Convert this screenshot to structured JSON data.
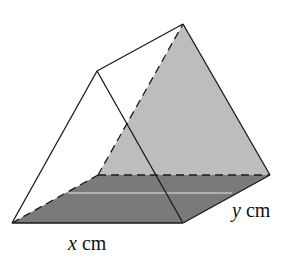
{
  "figure": {
    "type": "triangular prism",
    "labels": {
      "x_var": "x",
      "x_unit": " cm",
      "y_var": "y",
      "y_unit": " cm"
    },
    "colors": {
      "base_face": "#7a7a7a",
      "back_triangle_face": "#bdbdbd",
      "front_face": "#ffffff",
      "edge": "#1a1a1a",
      "highlight_line": "#e6e6e6"
    }
  }
}
